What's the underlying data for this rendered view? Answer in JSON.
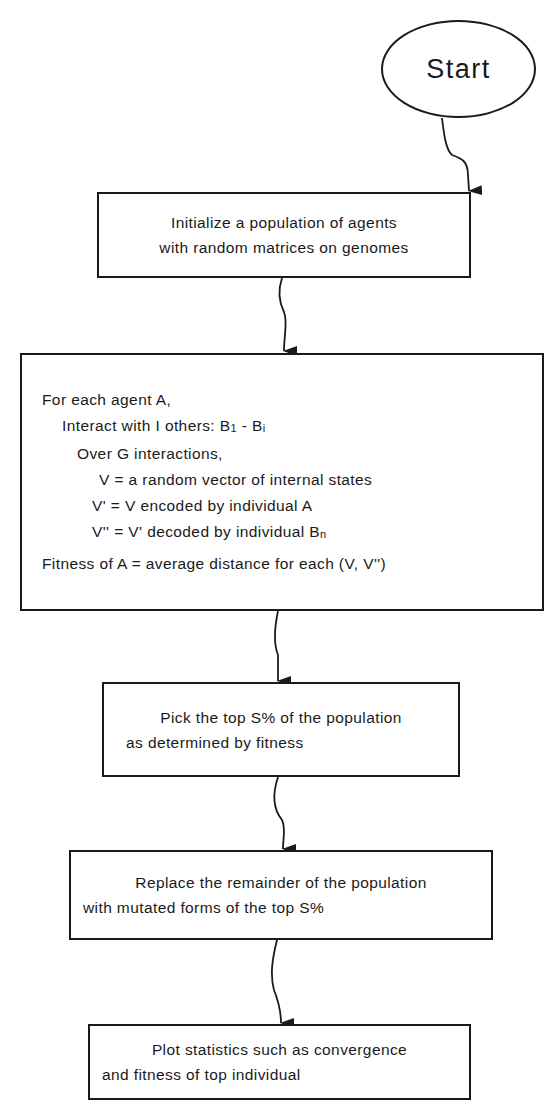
{
  "start": {
    "label": "Start"
  },
  "steps": [
    {
      "id": "init",
      "lines": [
        "Initialize a population of agents",
        "with random matrices on genomes"
      ]
    },
    {
      "id": "evaluate",
      "lines": [
        "For each agent A,",
        "Interact with I others: B",
        "Over G interactions,",
        "V = a random vector of internal states",
        "V' = V encoded by individual A",
        "V'' = V' decoded by individual B",
        "Fitness of A = average distance for each (V, V'')"
      ],
      "subscripts": {
        "b1": "1",
        "bi_sep": " - B",
        "bi": "i",
        "bn": "n"
      }
    },
    {
      "id": "select",
      "lines": [
        "Pick the top S% of the population",
        "as determined by fitness"
      ]
    },
    {
      "id": "mutate",
      "lines": [
        "Replace the remainder of the population",
        "with mutated forms of the top S%"
      ]
    },
    {
      "id": "plot",
      "lines": [
        "Plot statistics  such as convergence",
        "and fitness of top individual"
      ]
    }
  ],
  "colors": {
    "stroke": "#1a1a1a",
    "background": "#ffffff"
  }
}
